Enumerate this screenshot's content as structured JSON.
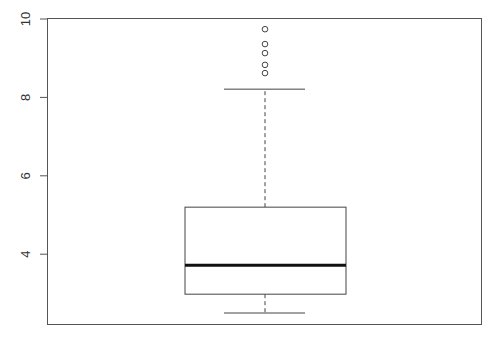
{
  "chart_data": {
    "type": "box",
    "title": "",
    "xlabel": "",
    "ylabel": "",
    "ylim": [
      2.3,
      10
    ],
    "yticks": [
      4,
      6,
      8,
      10
    ],
    "ytick_labels": [
      "4",
      "6",
      "8",
      "10"
    ],
    "grid": false,
    "legend": null,
    "series": [
      {
        "name": "",
        "whisker_low": 2.5,
        "q1": 2.98,
        "median": 3.72,
        "q3": 5.2,
        "whisker_high": 8.21,
        "outliers": [
          8.62,
          8.83,
          9.13,
          9.36,
          9.74
        ]
      }
    ]
  },
  "colors": {
    "axis": "#555555",
    "box": "#444444",
    "median": "#111111"
  }
}
